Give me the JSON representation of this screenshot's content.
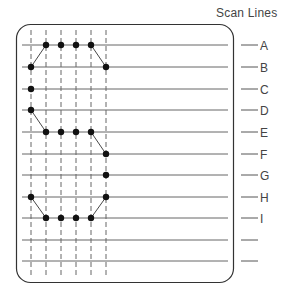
{
  "title": "Scan Lines",
  "scan_lines": [
    {
      "label": "A",
      "y": 45
    },
    {
      "label": "B",
      "y": 67
    },
    {
      "label": "C",
      "y": 89
    },
    {
      "label": "D",
      "y": 110
    },
    {
      "label": "E",
      "y": 132
    },
    {
      "label": "F",
      "y": 154
    },
    {
      "label": "G",
      "y": 175
    },
    {
      "label": "H",
      "y": 197
    },
    {
      "label": "I",
      "y": 218
    },
    {
      "label": "",
      "y": 240
    },
    {
      "label": "",
      "y": 261
    }
  ],
  "columns_x": [
    31,
    46,
    61,
    76,
    91,
    106
  ],
  "dots": [
    {
      "col": 1,
      "row": 0
    },
    {
      "col": 2,
      "row": 0
    },
    {
      "col": 3,
      "row": 0
    },
    {
      "col": 4,
      "row": 0
    },
    {
      "col": 0,
      "row": 1
    },
    {
      "col": 5,
      "row": 1
    },
    {
      "col": 0,
      "row": 2
    },
    {
      "col": 0,
      "row": 3
    },
    {
      "col": 1,
      "row": 4
    },
    {
      "col": 2,
      "row": 4
    },
    {
      "col": 3,
      "row": 4
    },
    {
      "col": 4,
      "row": 4
    },
    {
      "col": 5,
      "row": 5
    },
    {
      "col": 5,
      "row": 6
    },
    {
      "col": 0,
      "row": 7
    },
    {
      "col": 5,
      "row": 7
    },
    {
      "col": 1,
      "row": 8
    },
    {
      "col": 2,
      "row": 8
    },
    {
      "col": 3,
      "row": 8
    },
    {
      "col": 4,
      "row": 8
    }
  ],
  "connectors": [
    [
      [
        0,
        1
      ],
      [
        1,
        0
      ]
    ],
    [
      [
        4,
        0
      ],
      [
        5,
        1
      ]
    ],
    [
      [
        0,
        3
      ],
      [
        1,
        4
      ]
    ],
    [
      [
        4,
        4
      ],
      [
        5,
        5
      ]
    ],
    [
      [
        0,
        7
      ],
      [
        1,
        8
      ]
    ],
    [
      [
        4,
        8
      ],
      [
        5,
        7
      ]
    ]
  ]
}
